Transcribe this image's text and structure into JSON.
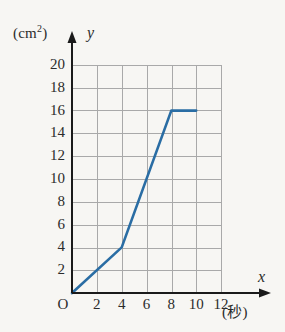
{
  "figure": {
    "y_axis_unit": "(cm",
    "y_axis_unit_sup": "2",
    "y_axis_unit_close": ")",
    "y_axis_variable": "y",
    "x_axis_variable": "x",
    "x_axis_unit": "(秒)",
    "origin_label": "O",
    "colors": {
      "line": "#2a6da4",
      "grid": "#a9a9a9",
      "axis": "#1a1a1a",
      "background": "#f7f6f3",
      "text": "#2b2b2b"
    }
  },
  "chart_data": {
    "type": "line",
    "title": "",
    "xlabel": "(秒)",
    "ylabel": "(cm²)",
    "xlim": [
      0,
      12
    ],
    "ylim": [
      0,
      20
    ],
    "grid": true,
    "legend": false,
    "x_ticks": [
      2,
      4,
      6,
      8,
      10,
      12
    ],
    "x_tick_labels": [
      "2",
      "4",
      "6",
      "8",
      "10",
      "12"
    ],
    "y_ticks": [
      2,
      4,
      6,
      8,
      10,
      12,
      14,
      16,
      18,
      20
    ],
    "y_tick_labels": [
      "2",
      "4",
      "6",
      "8",
      "10",
      "12",
      "14",
      "16",
      "18",
      "20"
    ],
    "series": [
      {
        "name": "area",
        "x": [
          0,
          4,
          8,
          10
        ],
        "y": [
          0,
          4,
          16,
          16
        ],
        "points": [
          {
            "x": 0,
            "y": 0
          },
          {
            "x": 4,
            "y": 4
          },
          {
            "x": 8,
            "y": 16
          },
          {
            "x": 10,
            "y": 16
          }
        ]
      }
    ]
  }
}
